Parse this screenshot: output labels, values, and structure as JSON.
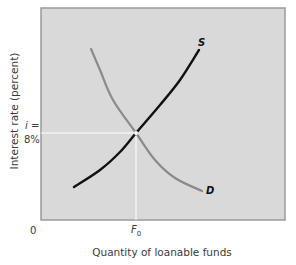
{
  "chart_data": {
    "type": "line",
    "title": "",
    "xlabel": "Quantity of loanable funds",
    "ylabel": "Interest rate (percent)",
    "x_ticks": [
      "0",
      "F0"
    ],
    "y_ticks": [
      "i = 8%"
    ],
    "equilibrium": {
      "x_label": "F0",
      "y_label": "i = 8%",
      "interest_rate_percent": 8
    },
    "series": [
      {
        "name": "S",
        "description": "Supply of loanable funds (upward sloping)",
        "color": "#111111",
        "points_px": [
          [
            74,
            187
          ],
          [
            100,
            170
          ],
          [
            120,
            152
          ],
          [
            136,
            133
          ],
          [
            160,
            105
          ],
          [
            180,
            80
          ],
          [
            199,
            50
          ]
        ]
      },
      {
        "name": "D",
        "description": "Demand for loanable funds (downward sloping)",
        "color": "#8a8a8a",
        "points_px": [
          [
            91,
            49
          ],
          [
            100,
            70
          ],
          [
            113,
            100
          ],
          [
            136,
            133
          ],
          [
            155,
            160
          ],
          [
            175,
            178
          ],
          [
            202,
            191
          ]
        ]
      }
    ],
    "grid": false,
    "legend": "curve labels inline (S, D)",
    "background": "#d9d9d9"
  },
  "labels": {
    "origin": "0",
    "y_eq_line1": "i =",
    "y_eq_line2": "8%",
    "x_eq_main": "F",
    "x_eq_sub": "0",
    "supply": "S",
    "demand": "D",
    "xlabel": "Quantity of loanable funds",
    "ylabel": "Interest rate (percent)"
  }
}
